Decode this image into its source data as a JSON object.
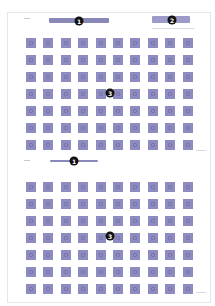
{
  "sections": [
    {
      "id": "top",
      "header_badge": "1",
      "cluster_badge": "2",
      "grid_badge": "3",
      "rows": 7,
      "columns": 10,
      "icon_color": "#8d8bc0"
    },
    {
      "id": "bottom",
      "header_badge": "1",
      "grid_badge": "3",
      "rows": 7,
      "columns": 10,
      "icon_color": "#8d8bc0"
    }
  ],
  "colors": {
    "accent": "#8a88b8",
    "badge": "#111111",
    "border": "#e6e6ea"
  }
}
